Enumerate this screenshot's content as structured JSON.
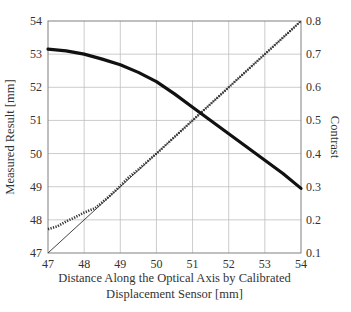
{
  "chart_data": {
    "type": "line",
    "title": "",
    "xlabel": "Distance Along the Optical Axis by Calibrated Displacement Sensor [mm]",
    "xlabel_lines": [
      "Distance Along the Optical Axis by Calibrated",
      "Displacement Sensor [mm]"
    ],
    "ylabel": "Measured Result [mm]",
    "y2label": "Contrast",
    "xlim": [
      47,
      54
    ],
    "ylim": [
      47,
      54
    ],
    "y2lim": [
      0.1,
      0.8
    ],
    "x_ticks": [
      "47",
      "48",
      "49",
      "50",
      "51",
      "52",
      "53",
      "54"
    ],
    "y_ticks": [
      "47",
      "48",
      "49",
      "50",
      "51",
      "52",
      "53",
      "54"
    ],
    "y2_ticks": [
      "0.1",
      "0.2",
      "0.3",
      "0.4",
      "0.5",
      "0.6",
      "0.7",
      "0.8"
    ],
    "grid": true,
    "legend": null,
    "series": [
      {
        "name": "Ideal (y = x)",
        "axis": "left",
        "style": "thin-solid",
        "x": [
          47,
          54
        ],
        "values": [
          47,
          54
        ]
      },
      {
        "name": "Measured Result",
        "axis": "left",
        "style": "dotted",
        "x": [
          47,
          47.25,
          47.5,
          47.75,
          48,
          48.3,
          48.6,
          49,
          49.2,
          49.5,
          50,
          50.5,
          51,
          51.5,
          52,
          52.5,
          53,
          53.5,
          54
        ],
        "values": [
          47.72,
          47.8,
          47.95,
          48.08,
          48.22,
          48.35,
          48.62,
          49.02,
          49.25,
          49.52,
          50.0,
          50.5,
          51.0,
          51.5,
          52.0,
          52.5,
          53.0,
          53.5,
          54.0
        ]
      },
      {
        "name": "Contrast",
        "axis": "right",
        "style": "thick-solid",
        "x": [
          47,
          47.5,
          48,
          48.5,
          49,
          49.5,
          50,
          50.5,
          51,
          51.5,
          52,
          52.5,
          53,
          53.5,
          54
        ],
        "values": [
          0.715,
          0.71,
          0.7,
          0.685,
          0.668,
          0.645,
          0.617,
          0.58,
          0.54,
          0.5,
          0.46,
          0.42,
          0.38,
          0.34,
          0.295
        ]
      }
    ]
  }
}
